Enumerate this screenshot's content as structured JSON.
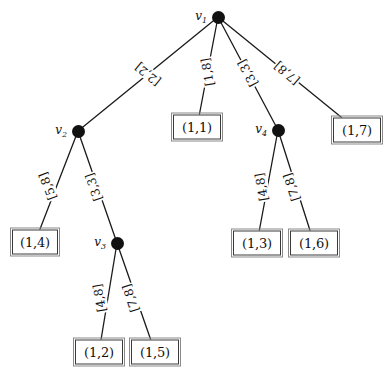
{
  "figure": {
    "kind": "weighted-tree-diagram",
    "width": 388,
    "height": 379,
    "background": "#ffffff",
    "ink_color": "#111111"
  },
  "nodes": [
    {
      "id": "v1",
      "label": "v",
      "sub": "1",
      "x": 218,
      "y": 17,
      "label_side": "left"
    },
    {
      "id": "v2",
      "label": "v",
      "sub": "2",
      "x": 78,
      "y": 131,
      "label_side": "left"
    },
    {
      "id": "v3",
      "label": "v",
      "sub": "3",
      "x": 117,
      "y": 243,
      "label_side": "left"
    },
    {
      "id": "v4",
      "label": "v",
      "sub": "4",
      "x": 278,
      "y": 130,
      "label_side": "left"
    }
  ],
  "leaves": [
    {
      "id": "l11",
      "text": "(1,1)",
      "cx": 197,
      "cy": 127,
      "w": 48,
      "h": 25
    },
    {
      "id": "l17",
      "text": "(1,7)",
      "cx": 357,
      "cy": 130,
      "w": 48,
      "h": 25
    },
    {
      "id": "l14",
      "text": "(1,4)",
      "cx": 35,
      "cy": 242,
      "w": 46,
      "h": 25
    },
    {
      "id": "l13",
      "text": "(1,3)",
      "cx": 257,
      "cy": 243,
      "w": 48,
      "h": 25
    },
    {
      "id": "l16",
      "text": "(1,6)",
      "cx": 314,
      "cy": 243,
      "w": 48,
      "h": 25
    },
    {
      "id": "l12",
      "text": "(1,2)",
      "cx": 99,
      "cy": 352,
      "w": 48,
      "h": 25
    },
    {
      "id": "l15",
      "text": "(1,5)",
      "cx": 155,
      "cy": 352,
      "w": 48,
      "h": 25
    }
  ],
  "edges": [
    {
      "id": "e-v1-v2",
      "from": "v1",
      "to": "v2",
      "label": "[2,2]",
      "lx": 148,
      "ly": 74,
      "rot": 39
    },
    {
      "id": "e-v1-l11",
      "from": "v1",
      "to": "l11",
      "label": "[1,8]",
      "lx": 208,
      "ly": 72,
      "rot": 80
    },
    {
      "id": "e-v1-v4",
      "from": "v1",
      "to": "v4",
      "label": "[3,3]",
      "lx": 248,
      "ly": 73,
      "rot": 62
    },
    {
      "id": "e-v1-l17",
      "from": "v1",
      "to": "l17",
      "label": "[7,8]",
      "lx": 287,
      "ly": 73,
      "rot": 40
    },
    {
      "id": "e-v2-l14",
      "from": "v2",
      "to": "l14",
      "label": "[5,8]",
      "lx": 48,
      "ly": 186,
      "rot": 69
    },
    {
      "id": "e-v2-v3",
      "from": "v2",
      "to": "v3",
      "label": "[3,3]",
      "lx": 94,
      "ly": 187,
      "rot": 71
    },
    {
      "id": "e-v3-l12",
      "from": "v3",
      "to": "l12",
      "label": "[4,8]",
      "lx": 100,
      "ly": 298,
      "rot": 80
    },
    {
      "id": "e-v3-l15",
      "from": "v3",
      "to": "l15",
      "label": "[7,8]",
      "lx": 131,
      "ly": 298,
      "rot": 72
    },
    {
      "id": "e-v4-l13",
      "from": "v4",
      "to": "l13",
      "label": "[4,8]",
      "lx": 262,
      "ly": 187,
      "rot": 80
    },
    {
      "id": "e-v4-l16",
      "from": "v4",
      "to": "l16",
      "label": "[7,8]",
      "lx": 292,
      "ly": 187,
      "rot": 72
    }
  ]
}
